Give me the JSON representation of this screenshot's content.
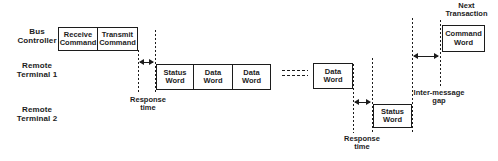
{
  "diagram": {
    "lanes": [
      {
        "label": "Bus\nController"
      },
      {
        "label": "Remote\nTerminal 1"
      },
      {
        "label": "Remote\nTerminal 2"
      }
    ],
    "bus_controller_row": [
      {
        "label": "Receive\nCommand"
      },
      {
        "label": "Transmit\nCommand"
      }
    ],
    "rt1_row": [
      {
        "label": "Status\nWord"
      },
      {
        "label": "Data\nWord"
      },
      {
        "label": "Data\nWord"
      }
    ],
    "rt1_row_continued": {
      "label": "Data\nWord"
    },
    "rt2_row": {
      "label": "Status\nWord"
    },
    "next_transaction": {
      "title": "Next\nTransaction",
      "box_label": "Command\nWord"
    },
    "annotations": {
      "response_time_1": "Response\ntime",
      "response_time_2": "Response\ntime",
      "inter_message_gap": "Inter-message\ngap"
    },
    "colors": {
      "ink": "#1c1c1c",
      "background": "#ffffff"
    }
  }
}
